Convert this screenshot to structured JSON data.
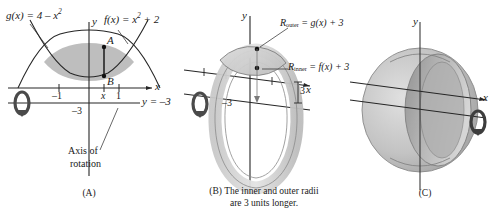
{
  "figure": {
    "type": "calculus-solid-of-revolution-washer-method",
    "panels": [
      {
        "id": "A",
        "caption": "(A)",
        "axis_labels": {
          "x": "x",
          "y": "y"
        },
        "curves": [
          {
            "name": "g",
            "label_text": "g(x) = 4 – x",
            "label_exponent": "2",
            "expression": "g(x) = 4 - x^2",
            "opens": "down",
            "vertex": [
              0,
              4
            ]
          },
          {
            "name": "f",
            "label_text": "f(x) = x",
            "label_exponent": "2",
            "label_tail": "+ 2",
            "expression": "f(x) = x^2 + 2",
            "opens": "up",
            "vertex": [
              0,
              2
            ]
          }
        ],
        "points": [
          {
            "label": "A",
            "on_curve": "g",
            "description": "upper point on g(x)"
          },
          {
            "label": "B",
            "on_curve": "f",
            "description": "lower point on f(x)"
          }
        ],
        "tick_labels": [
          "–1",
          "x",
          "1"
        ],
        "axis_of_rotation": {
          "line_label": "y = –3",
          "y_intercept_label": "–3",
          "annotation_line1": "Axis of",
          "annotation_line2": "rotation"
        },
        "rotation_icon": "rotation-arrow-icon",
        "shaded_region": "region between f and g from x = -1 to x = 1"
      },
      {
        "id": "B",
        "caption_line1": "(B) The inner and outer radii",
        "caption_line2": "are 3 units longer.",
        "axis_labels": {
          "x": "x",
          "y": "y"
        },
        "radii": [
          {
            "name": "R_outer",
            "sub": "outer",
            "prefix": "R",
            "equation": " = g(x) + 3"
          },
          {
            "name": "R_inner",
            "sub": "inner",
            "prefix": "R",
            "equation": " = f(x) + 3"
          }
        ],
        "measure_label": "3",
        "y_tick_label": "–3",
        "rotation_icon": "rotation-arrow-icon"
      },
      {
        "id": "C",
        "caption": "(C)",
        "axis_labels": {
          "x": "x",
          "y": "y"
        },
        "rotation_icon": "rotation-arrow-icon",
        "description": "resulting solid of revolution"
      }
    ]
  },
  "colors": {
    "stroke": "#262626",
    "shade_fill": "#b9b9b9",
    "solid_light": "#d2d2d2",
    "solid_mid": "#b4b4b4",
    "solid_dark": "#8d8d8d",
    "background": "#ffffff"
  }
}
